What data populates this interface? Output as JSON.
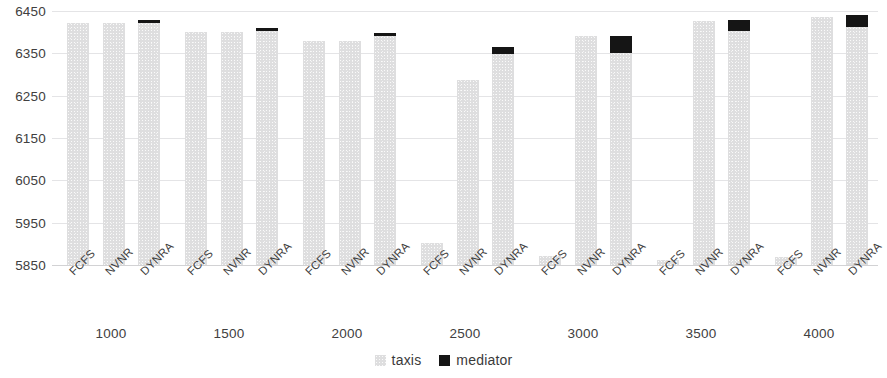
{
  "chart_data": {
    "type": "bar",
    "title": "",
    "subtitle": "",
    "xlabel": "",
    "ylabel": "",
    "stacked": true,
    "grid": true,
    "legend_position": "bottom-center",
    "ylim": [
      5850,
      6450
    ],
    "ytick_labels": [
      "6450",
      "6350",
      "6250",
      "6150",
      "6050",
      "5950",
      "5850"
    ],
    "yticks": [
      6450,
      6350,
      6250,
      6150,
      6050,
      5950,
      5850
    ],
    "group_labels": [
      "1000",
      "1500",
      "2000",
      "2500",
      "3000",
      "3500",
      "4000"
    ],
    "categories": [
      "FCFS",
      "NVNR",
      "DYNRA",
      "FCFS",
      "NVNR",
      "DYNRA",
      "FCFS",
      "NVNR",
      "DYNRA",
      "FCFS",
      "NVNR",
      "DYNRA",
      "FCFS",
      "NVNR",
      "DYNRA",
      "FCFS",
      "NVNR",
      "DYNRA",
      "FCFS",
      "NVNR",
      "DYNRA"
    ],
    "series": [
      {
        "name": "taxis",
        "color": "#dededf",
        "values": [
          6422,
          6422,
          6421,
          6400,
          6400,
          6403,
          6378,
          6378,
          6390,
          5903,
          6288,
          6348,
          5872,
          6392,
          6350,
          5861,
          6427,
          6403,
          5868,
          6436,
          6412
        ]
      },
      {
        "name": "mediator",
        "color": "#151515",
        "values": [
          0,
          0,
          7,
          0,
          0,
          8,
          0,
          0,
          6,
          0,
          0,
          17,
          0,
          0,
          40,
          0,
          0,
          26,
          0,
          0,
          28
        ]
      }
    ],
    "totals": [
      6422,
      6422,
      6428,
      6400,
      6400,
      6411,
      6378,
      6378,
      6396,
      5903,
      6288,
      6365,
      5872,
      6392,
      6390,
      5861,
      6427,
      6429,
      5868,
      6436,
      6440
    ],
    "legend": [
      "taxis",
      "mediator"
    ]
  }
}
